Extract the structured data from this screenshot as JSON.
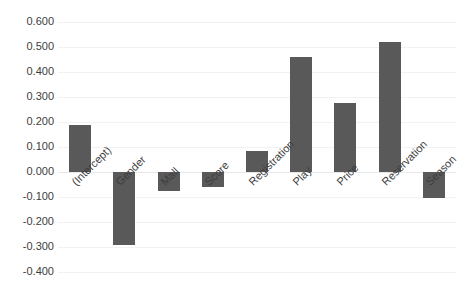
{
  "chart_data": {
    "type": "bar",
    "title": "",
    "subtitle": "",
    "xlabel": "",
    "ylabel": "",
    "categories": [
      "(Intercept)",
      "Gender",
      "Mall",
      "Score",
      "Registration",
      "Play",
      "Price",
      "Reservation",
      "Season"
    ],
    "values": [
      0.19,
      -0.29,
      -0.076,
      -0.06,
      0.084,
      0.46,
      0.276,
      0.52,
      -0.104
    ],
    "ylim": [
      -0.4,
      0.6
    ],
    "yticks": [
      0.6,
      0.5,
      0.4,
      0.3,
      0.2,
      0.1,
      0.0,
      -0.1,
      -0.2,
      -0.3,
      -0.4
    ],
    "ytick_labels": [
      "0.600",
      "0.500",
      "0.400",
      "0.300",
      "0.200",
      "0.100",
      "0.000",
      "-0.100",
      "-0.200",
      "-0.300",
      "-0.400"
    ],
    "grid": true,
    "legend": false,
    "legend_position": "none",
    "series": [
      {
        "name": "Coefficient",
        "values": [
          0.19,
          -0.29,
          -0.076,
          -0.06,
          0.084,
          0.46,
          0.276,
          0.52,
          -0.104
        ]
      }
    ],
    "colors": {
      "bar": "#595959",
      "gridline": "#f2f2f2",
      "zero_line": "#e8e8e8",
      "tick_text": "#3d3d3d",
      "background": "#ffffff"
    },
    "label_rotation_deg": -45
  }
}
